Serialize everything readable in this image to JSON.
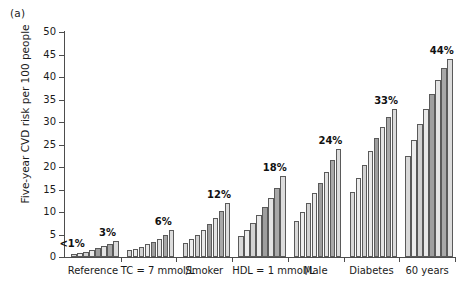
{
  "figure": {
    "panel_letter": "(a)",
    "y_axis_title": "Five-year CVD risk per 100 people"
  },
  "chart_data": {
    "type": "bar",
    "title": "",
    "xlabel": "",
    "ylabel": "Five-year CVD risk per 100 people",
    "ylim": [
      0,
      50
    ],
    "ytick_step": 5,
    "ytick_labels": [
      "0",
      "5",
      "10",
      "15",
      "20",
      "25",
      "30",
      "35",
      "40",
      "45",
      "50"
    ],
    "grid": false,
    "legend": "none",
    "bars_per_group": 8,
    "categories": [
      "Reference",
      "TC = 7 mmol/L",
      "Smoker",
      "HDL = 1 mmol/L",
      "Male",
      "Diabetes",
      "60 years"
    ],
    "group_annotations": [
      "<1%",
      "3%",
      "6%",
      "12%",
      "18%",
      "24%",
      "33%",
      "44%"
    ],
    "annotations": [
      {
        "category": "Reference",
        "text": "<1%",
        "placement": "left-of-group"
      },
      {
        "category": "Reference",
        "text": "3%",
        "placement": "above-last-bar"
      },
      {
        "category": "TC = 7 mmol/L",
        "text": "6%",
        "placement": "above-last-bar"
      },
      {
        "category": "Smoker",
        "text": "12%",
        "placement": "above-last-bar"
      },
      {
        "category": "HDL = 1 mmol/L",
        "text": "18%",
        "placement": "above-last-bar"
      },
      {
        "category": "Male",
        "text": "24%",
        "placement": "above-last-bar"
      },
      {
        "category": "Diabetes",
        "text": "33%",
        "placement": "above-last-bar"
      },
      {
        "category": "60 years",
        "text": "44%",
        "placement": "above-last-bar"
      }
    ],
    "bar_shades": [
      "#d8d8d8",
      "#ededed",
      "#d2d2d2",
      "#e9e9e9",
      "#9e9e9e",
      "#e3e3e3",
      "#a8a8a8",
      "#dcdcdc"
    ],
    "groups": [
      {
        "label": "Reference",
        "values": [
          0.6,
          0.9,
          1.2,
          1.6,
          2.0,
          2.5,
          3.0,
          3.6
        ]
      },
      {
        "label": "TC = 7 mmol/L",
        "values": [
          1.5,
          1.8,
          2.3,
          2.8,
          3.4,
          4.0,
          4.9,
          6.0
        ]
      },
      {
        "label": "Smoker",
        "values": [
          3.2,
          4.0,
          4.9,
          6.0,
          7.3,
          8.7,
          10.3,
          12.0
        ]
      },
      {
        "label": "HDL = 1 mmol/L",
        "values": [
          4.7,
          6.1,
          7.5,
          9.3,
          11.2,
          13.2,
          15.4,
          18.0
        ]
      },
      {
        "label": "Male",
        "values": [
          7.9,
          9.9,
          12.0,
          14.2,
          16.5,
          19.0,
          21.5,
          24.0
        ]
      },
      {
        "label": "Diabetes",
        "values": [
          14.5,
          17.5,
          20.5,
          23.5,
          26.4,
          29.0,
          31.2,
          33.0
        ]
      },
      {
        "label": "60 years",
        "values": [
          22.5,
          26.0,
          29.5,
          33.0,
          36.3,
          39.3,
          42.0,
          44.0
        ]
      }
    ]
  }
}
